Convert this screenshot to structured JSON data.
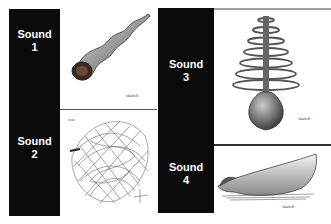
{
  "panels": [
    {
      "label_word": "Sound",
      "label_num": "1",
      "drawing": "twisted-horn-sketch"
    },
    {
      "label_word": "Sound",
      "label_num": "2",
      "drawing": "tangled-scribble-ball-sketch"
    },
    {
      "label_word": "Sound",
      "label_num": "3",
      "drawing": "stacked-rings-bulb-sketch"
    },
    {
      "label_word": "Sound",
      "label_num": "4",
      "drawing": "curved-boat-bowl-sketch"
    }
  ],
  "colors": {
    "label_bg": "#0b0b0b",
    "label_text": "#ffffff",
    "divider": "#555555"
  }
}
